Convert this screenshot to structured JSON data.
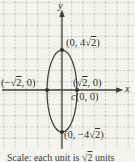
{
  "figure": {
    "y_axis_label": "y",
    "x_axis_label": "x",
    "point_labels": {
      "top": {
        "pre": "(0, 4√",
        "rad": "2",
        "post": ")"
      },
      "right": {
        "pre": "(√",
        "rad": "2",
        "post": ", 0)"
      },
      "left": {
        "pre": "(−√",
        "rad": "2",
        "post": ", 0)"
      },
      "bottom": {
        "pre": "(0, −4√",
        "rad": "2",
        "post": ")"
      },
      "center": {
        "italic": "c",
        "rest": "(0, 0)"
      }
    },
    "caption": {
      "pre": "Scale: each unit is √",
      "rad": "2",
      "post": " units"
    }
  },
  "geometry": {
    "type": "ellipse-graph",
    "ellipse": {
      "center": "c(0, 0)",
      "semi_axis_x": "√2",
      "semi_axis_y": "4√2",
      "orientation": "vertical-major-axis"
    },
    "marked_points": [
      "(0, 4√2)",
      "(√2, 0)",
      "(−√2, 0)",
      "c(0, 0)",
      "(0, −4√2)"
    ]
  },
  "colors": {
    "background": "#f4f4ef",
    "grid": "#b3b7ac",
    "axis": "#3f3e39",
    "curve": "#3f3e39",
    "text": "#2f2e2a"
  }
}
